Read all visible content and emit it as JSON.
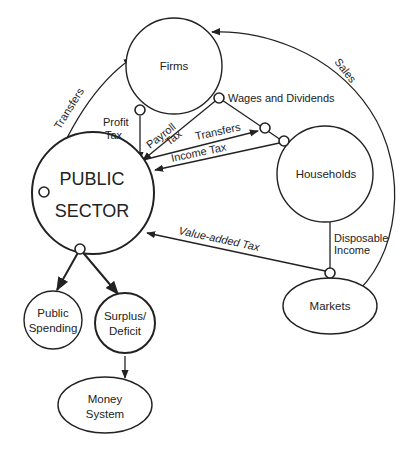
{
  "nodes": {
    "firms": "Firms",
    "households": "Households",
    "public_sector_line1": "PUBLIC",
    "public_sector_line2": "SECTOR",
    "markets": "Markets",
    "public_spending_line1": "Public",
    "public_spending_line2": "Spending",
    "surplus_deficit_line1": "Surplus/",
    "surplus_deficit_line2": "Deficit",
    "money_system_line1": "Money",
    "money_system_line2": "System"
  },
  "edges": {
    "transfers_to_firms": "Transfers",
    "sales": "Sales",
    "wages_and_dividends": "Wages and Dividends",
    "profit_tax_line1": "Profit",
    "profit_tax_line2": "Tax",
    "payroll_tax_line1": "Payroll",
    "payroll_tax_line2": "Tax",
    "transfers_to_households": "Transfers",
    "income_tax": "Income Tax",
    "value_added_tax": "Value-added Tax",
    "disposable_income_line1": "Disposable",
    "disposable_income_line2": "Income"
  }
}
